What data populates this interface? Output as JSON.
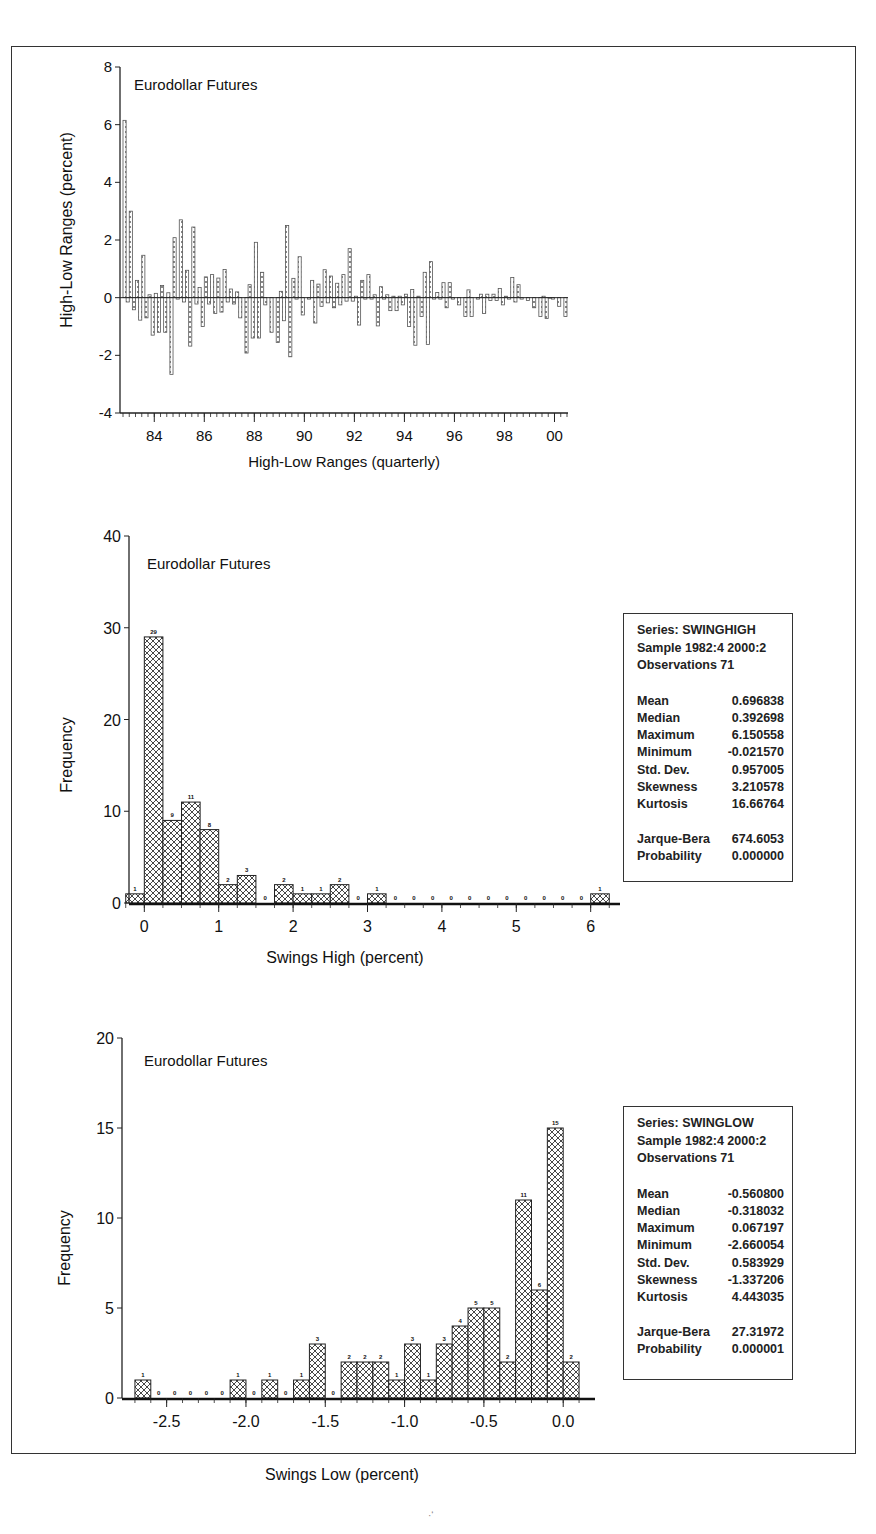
{
  "figure": {
    "page_mark": "·‘"
  },
  "chart_data": [
    {
      "type": "bar",
      "id": "high_low_ranges",
      "title": "Eurodollar Futures",
      "xlabel": "High-Low Ranges (quarterly)",
      "ylabel": "High-Low Ranges (percent)",
      "ylim": [
        -4,
        8
      ],
      "yticks": [
        -4,
        -2,
        0,
        2,
        4,
        6,
        8
      ],
      "xticks": [
        "84",
        "86",
        "88",
        "90",
        "92",
        "94",
        "96",
        "98",
        "00"
      ],
      "x_start": "1982:4",
      "x_end": "2000:2",
      "series": [
        {
          "name": "SWINGHIGH",
          "values": [
            6.15,
            3.0,
            0.6,
            1.47,
            0.1,
            0.15,
            0.42,
            0.17,
            2.08,
            2.7,
            0.95,
            2.45,
            0.35,
            0.72,
            0.8,
            0.68,
            0.98,
            0.3,
            0.2,
            0.0,
            0.45,
            1.92,
            0.88,
            0.0,
            0.0,
            0.22,
            2.5,
            0.67,
            1.42,
            0.0,
            0.6,
            0.47,
            0.97,
            0.75,
            0.5,
            0.8,
            1.7,
            0.05,
            0.6,
            0.8,
            0.1,
            0.38,
            0.1,
            0.05,
            0.05,
            0.12,
            0.28,
            0.05,
            0.88,
            1.25,
            0.18,
            0.52,
            0.52,
            0.0,
            0.0,
            0.27,
            0.0,
            0.12,
            0.12,
            0.12,
            0.32,
            0.05,
            0.7,
            0.45,
            0.0,
            0.0,
            0.0,
            0.05,
            -0.02,
            0.0,
            0.0
          ]
        },
        {
          "name": "SWINGLOW",
          "values": [
            -0.15,
            -0.42,
            -0.78,
            -0.7,
            -1.3,
            -1.2,
            -1.2,
            -2.66,
            -0.05,
            -0.15,
            -1.68,
            -0.22,
            -1.0,
            -0.22,
            -0.55,
            -0.5,
            -0.15,
            -0.22,
            -0.7,
            -1.92,
            -1.4,
            -1.4,
            -0.25,
            -1.2,
            -1.55,
            -0.8,
            -2.05,
            -0.05,
            -0.6,
            -0.05,
            -0.88,
            -0.3,
            -0.18,
            -0.35,
            -0.25,
            -0.12,
            -0.12,
            -0.95,
            -0.05,
            -0.05,
            -0.98,
            -0.05,
            -0.45,
            -0.45,
            -0.25,
            -1.0,
            -1.65,
            -0.65,
            -1.62,
            -0.05,
            -0.05,
            -0.35,
            -0.05,
            -0.25,
            -0.65,
            -0.65,
            -0.05,
            -0.55,
            -0.1,
            -0.1,
            -0.25,
            -0.05,
            -0.15,
            -0.05,
            -0.1,
            -0.35,
            -0.65,
            -0.72,
            -0.05,
            -0.3,
            -0.65
          ]
        }
      ]
    },
    {
      "type": "bar",
      "id": "swings_high_hist",
      "title": "Eurodollar Futures",
      "xlabel": "Swings High (percent)",
      "ylabel": "Frequency",
      "ylim": [
        0,
        40
      ],
      "yticks": [
        0,
        10,
        20,
        30,
        40
      ],
      "xlim": [
        -0.3,
        6.3
      ],
      "xticks": [
        0,
        1,
        2,
        3,
        4,
        5,
        6
      ],
      "bin_start": -0.25,
      "bin_width": 0.25,
      "values": [
        1,
        29,
        9,
        11,
        8,
        2,
        3,
        0,
        2,
        1,
        1,
        2,
        0,
        1,
        0,
        0,
        0,
        0,
        0,
        0,
        0,
        0,
        0,
        0,
        0,
        1
      ],
      "stats": {
        "series": "Series: SWINGHIGH",
        "sample": "Sample 1982:4 2000:2",
        "observations": "Observations 71",
        "rows": [
          {
            "label": "Mean",
            "value": "0.696838"
          },
          {
            "label": "Median",
            "value": "0.392698"
          },
          {
            "label": "Maximum",
            "value": "6.150558"
          },
          {
            "label": "Minimum",
            "value": "-0.021570"
          },
          {
            "label": "Std. Dev.",
            "value": "0.957005"
          },
          {
            "label": "Skewness",
            "value": "3.210578"
          },
          {
            "label": "Kurtosis",
            "value": "16.66764"
          }
        ],
        "tests": [
          {
            "label": "Jarque-Bera",
            "value": "674.6053"
          },
          {
            "label": "Probability",
            "value": "0.000000"
          }
        ]
      }
    },
    {
      "type": "bar",
      "id": "swings_low_hist",
      "title": "Eurodollar Futures",
      "xlabel": "Swings Low (percent)",
      "ylabel": "Frequency",
      "ylim": [
        0,
        20
      ],
      "yticks": [
        0,
        5,
        10,
        15,
        20
      ],
      "xlim": [
        -2.75,
        0.15
      ],
      "xticks": [
        -2.5,
        -2.0,
        -1.5,
        -1.0,
        -0.5,
        0.0
      ],
      "xtick_labels": [
        "-2.5",
        "-2.0",
        "-1.5",
        "-1.0",
        "-0.5",
        "0.0"
      ],
      "bin_start": -2.7,
      "bin_width": 0.1,
      "values": [
        1,
        0,
        0,
        0,
        0,
        0,
        1,
        0,
        1,
        0,
        1,
        3,
        0,
        2,
        2,
        2,
        1,
        3,
        1,
        3,
        4,
        5,
        5,
        2,
        11,
        6,
        15,
        2
      ],
      "stats": {
        "series": "Series: SWINGLOW",
        "sample": "Sample 1982:4 2000:2",
        "observations": "Observations 71",
        "rows": [
          {
            "label": "Mean",
            "value": "-0.560800"
          },
          {
            "label": "Median",
            "value": "-0.318032"
          },
          {
            "label": "Maximum",
            "value": "0.067197"
          },
          {
            "label": "Minimum",
            "value": "-2.660054"
          },
          {
            "label": "Std. Dev.",
            "value": "0.583929"
          },
          {
            "label": "Skewness",
            "value": "-1.337206"
          },
          {
            "label": "Kurtosis",
            "value": "4.443035"
          }
        ],
        "tests": [
          {
            "label": "Jarque-Bera",
            "value": "27.31972"
          },
          {
            "label": "Probability",
            "value": "0.000001"
          }
        ]
      }
    }
  ]
}
